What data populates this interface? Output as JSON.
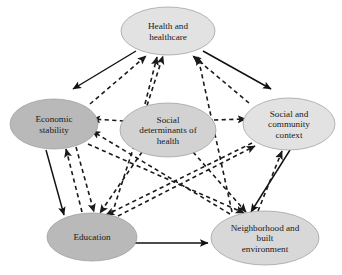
{
  "diagram": {
    "type": "node-link-diagram",
    "canvas": {
      "width": 342,
      "height": 275,
      "background": "#ffffff"
    },
    "styles": {
      "node_fill_light": "#e2e2e2",
      "node_fill_dark": "#b9b9b9",
      "node_fill_mid": "#d2d2d2",
      "node_stroke": "#9a9a9a",
      "solid_edge_color": "#111111",
      "dashed_edge_color": "#1a1a1a",
      "label_color": "#1a1a1a"
    },
    "nodes": [
      {
        "id": "health",
        "name": "health-and-healthcare",
        "lines": [
          "Health and",
          "healthcare"
        ],
        "cx": 168,
        "cy": 31,
        "rx": 47,
        "ry": 24,
        "fill": "#e2e2e2"
      },
      {
        "id": "economic",
        "name": "economic-stability",
        "lines": [
          "Economic",
          "stability"
        ],
        "cx": 54,
        "cy": 124,
        "rx": 44,
        "ry": 25,
        "fill": "#b9b9b9"
      },
      {
        "id": "sdoh",
        "name": "social-determinants-of-health",
        "lines": [
          "Social",
          "determinants of",
          "health"
        ],
        "cx": 168,
        "cy": 130,
        "rx": 48,
        "ry": 27,
        "fill": "#d2d2d2"
      },
      {
        "id": "social",
        "name": "social-and-community-context",
        "lines": [
          "Social and",
          "community",
          "context"
        ],
        "cx": 289,
        "cy": 124,
        "rx": 46,
        "ry": 26,
        "fill": "#e2e2e2"
      },
      {
        "id": "education",
        "name": "education",
        "lines": [
          "Education"
        ],
        "cx": 92,
        "cy": 237,
        "rx": 45,
        "ry": 24,
        "fill": "#b9b9b9"
      },
      {
        "id": "neighborhood",
        "name": "neighborhood-and-built-environment",
        "lines": [
          "Neighborhood and",
          "built",
          "environment"
        ],
        "cx": 265,
        "cy": 238,
        "rx": 54,
        "ry": 27,
        "fill": "#d8d8d8"
      }
    ],
    "edges": [
      {
        "name": "edge-health-to-economic",
        "style": "solid",
        "from": "health",
        "to": "economic",
        "x1": 136,
        "y1": 51,
        "x2": 73,
        "y2": 89
      },
      {
        "name": "edge-health-to-social",
        "style": "solid",
        "from": "health",
        "to": "social",
        "x1": 203,
        "y1": 51,
        "x2": 271,
        "y2": 89
      },
      {
        "name": "edge-economic-to-education",
        "style": "solid",
        "from": "economic",
        "to": "education",
        "x1": 46,
        "y1": 150,
        "x2": 64,
        "y2": 215
      },
      {
        "name": "edge-social-to-neighborhood",
        "style": "solid",
        "from": "social",
        "to": "neighborhood",
        "x1": 290,
        "y1": 150,
        "x2": 251,
        "y2": 212
      },
      {
        "name": "edge-education-to-neighborhood",
        "style": "solid",
        "from": "education",
        "to": "neighborhood",
        "x1": 135,
        "y1": 243,
        "x2": 208,
        "y2": 243
      },
      {
        "name": "edge-sdoh-to-economic",
        "style": "dashed",
        "from": "sdoh",
        "to": "economic",
        "x1": 124,
        "y1": 121,
        "x2": 92,
        "y2": 119
      },
      {
        "name": "edge-sdoh-to-social",
        "style": "dashed",
        "from": "sdoh",
        "to": "social",
        "x1": 214,
        "y1": 120,
        "x2": 246,
        "y2": 119
      },
      {
        "name": "edge-economic-to-health",
        "style": "dashed",
        "from": "economic",
        "to": "health",
        "x1": 90,
        "y1": 104,
        "x2": 146,
        "y2": 56
      },
      {
        "name": "edge-sdoh-to-health-left",
        "style": "dashed",
        "from": "sdoh",
        "to": "health",
        "x1": 145,
        "y1": 104,
        "x2": 157,
        "y2": 57
      },
      {
        "name": "edge-education-to-health",
        "style": "dashed",
        "from": "education",
        "to": "health",
        "x1": 112,
        "y1": 214,
        "x2": 163,
        "y2": 56
      },
      {
        "name": "edge-social-to-health",
        "style": "dashed",
        "from": "social",
        "to": "health",
        "x1": 249,
        "y1": 103,
        "x2": 193,
        "y2": 56
      },
      {
        "name": "edge-neighborhood-to-health",
        "style": "dashed",
        "from": "neighborhood",
        "to": "health",
        "x1": 232,
        "y1": 212,
        "x2": 198,
        "y2": 57
      },
      {
        "name": "edge-sdoh-to-education",
        "style": "dashed",
        "from": "sdoh",
        "to": "education",
        "x1": 142,
        "y1": 152,
        "x2": 100,
        "y2": 213
      },
      {
        "name": "edge-sdoh-to-neighborhood",
        "style": "dashed",
        "from": "sdoh",
        "to": "neighborhood",
        "x1": 193,
        "y1": 152,
        "x2": 246,
        "y2": 212
      },
      {
        "name": "edge-economic-to-neighborhood",
        "style": "dashed",
        "from": "economic",
        "to": "neighborhood",
        "x1": 88,
        "y1": 144,
        "x2": 244,
        "y2": 213
      },
      {
        "name": "edge-neighborhood-to-economic",
        "style": "dashed",
        "from": "neighborhood",
        "to": "economic",
        "x1": 230,
        "y1": 214,
        "x2": 92,
        "y2": 131
      },
      {
        "name": "edge-social-to-education",
        "style": "dashed",
        "from": "social",
        "to": "education",
        "x1": 252,
        "y1": 143,
        "x2": 106,
        "y2": 215
      },
      {
        "name": "edge-education-to-social",
        "style": "dashed",
        "from": "education",
        "to": "social",
        "x1": 118,
        "y1": 216,
        "x2": 255,
        "y2": 146
      },
      {
        "name": "edge-economic-to-education-dashed",
        "style": "dashed",
        "from": "economic",
        "to": "education",
        "x1": 76,
        "y1": 147,
        "x2": 94,
        "y2": 212
      },
      {
        "name": "edge-education-to-economic-dashed",
        "style": "dashed",
        "from": "education",
        "to": "economic",
        "x1": 82,
        "y1": 212,
        "x2": 66,
        "y2": 149
      },
      {
        "name": "edge-neighborhood-to-social-dashed",
        "style": "dashed",
        "from": "neighborhood",
        "to": "social",
        "x1": 258,
        "y1": 211,
        "x2": 282,
        "y2": 151
      }
    ]
  }
}
